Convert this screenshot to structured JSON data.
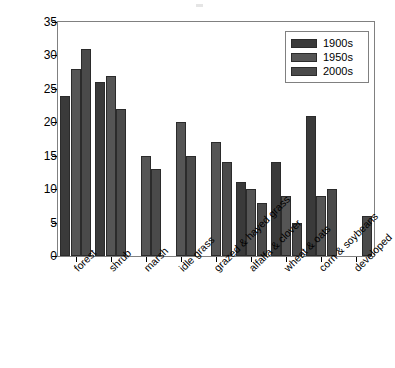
{
  "chart_data": {
    "type": "bar",
    "title": "",
    "subtitle": "",
    "xlabel": "",
    "ylabel": "No. of most important species",
    "ylim": [
      0,
      35
    ],
    "yticks": [
      0,
      5,
      10,
      15,
      20,
      25,
      30,
      35
    ],
    "ytick_labels": [
      "0",
      "5",
      "10",
      "15",
      "20",
      "25",
      "30",
      "35"
    ],
    "grid": false,
    "legend_position": "top-right",
    "categories": [
      "forest",
      "shrub",
      "marsh",
      "idle grass",
      "grazed & hayed grass",
      "alfalfa & clover",
      "wheat & oats",
      "corn & soybeans",
      "developed"
    ],
    "series": [
      {
        "name": "1900s",
        "color": "#3a3a3a",
        "values": [
          24,
          26,
          null,
          null,
          null,
          11,
          14,
          21,
          null
        ]
      },
      {
        "name": "1950s",
        "color": "#555555",
        "values": [
          28,
          27,
          15,
          20,
          17,
          10,
          9,
          9,
          null
        ]
      },
      {
        "name": "2000s",
        "color": "#4a4a4a",
        "values": [
          31,
          22,
          13,
          15,
          14,
          8,
          5,
          10,
          6
        ]
      }
    ]
  },
  "legend": {
    "entries": [
      {
        "label": "1900s",
        "color": "#3a3a3a"
      },
      {
        "label": "1950s",
        "color": "#555555"
      },
      {
        "label": "2000s",
        "color": "#4a4a4a"
      }
    ]
  },
  "axes": {
    "y_title": "No. of most important species"
  }
}
